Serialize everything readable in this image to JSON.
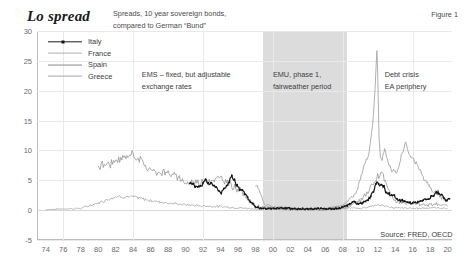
{
  "header": {
    "title": "Lo spread",
    "subtitle_line1": "Spreads, 10 year sovereign bonds,",
    "subtitle_line2": "compared to German “Bund”",
    "figure_number": "Figure  1"
  },
  "annotations": {
    "ems_line1": "EMS – fixed, but adjustable",
    "ems_line2": "exchange rates",
    "emu_line1": "EMU, phase 1,",
    "emu_line2": "fairweather period",
    "crisis_line1": "Debt crisis",
    "crisis_line2": "EA periphery",
    "source": "Source: FRED, OECD"
  },
  "chart_data": {
    "type": "line",
    "title": "Lo spread",
    "subtitle": "Spreads, 10 year sovereign bonds, compared to German “Bund”",
    "xlabel": "",
    "ylabel": "",
    "xlim": [
      1973,
      2020.5
    ],
    "ylim": [
      -5,
      30
    ],
    "grid": true,
    "legend_position": "top-left",
    "ytick_labels": [
      "30",
      "25",
      "20",
      "15",
      "10",
      "5",
      "0",
      "-5"
    ],
    "ytick_values": [
      30,
      25,
      20,
      15,
      10,
      5,
      0,
      -5
    ],
    "xtick_labels": [
      "74",
      "76",
      "78",
      "80",
      "82",
      "84",
      "86",
      "88",
      "90",
      "92",
      "94",
      "96",
      "98",
      "00",
      "02",
      "04",
      "06",
      "08",
      "10",
      "12",
      "14",
      "16",
      "18",
      "20"
    ],
    "xtick_values": [
      1974,
      1976,
      1978,
      1980,
      1982,
      1984,
      1986,
      1988,
      1990,
      1992,
      1994,
      1996,
      1998,
      2000,
      2002,
      2004,
      2006,
      2008,
      2010,
      2012,
      2014,
      2016,
      2018,
      2020
    ],
    "shaded_bands": [
      {
        "label": "EMU, phase 1, fairweather period",
        "x0": 1998.9,
        "x1": 2008.5,
        "color": "#d9d9d9"
      }
    ],
    "series": [
      {
        "name": "Italy",
        "color": "#1c1c1c",
        "style": "line-with-markers",
        "x": [
          1990.5,
          1990.9,
          1991.2,
          1991.5,
          1991.8,
          1992.1,
          1992.3,
          1992.5,
          1992.7,
          1992.9,
          1993.1,
          1993.4,
          1993.7,
          1994.0,
          1994.3,
          1994.6,
          1994.9,
          1995.1,
          1995.3,
          1995.5,
          1995.7,
          1995.9,
          1996.2,
          1996.5,
          1996.8,
          1997.1,
          1997.4,
          1997.7,
          1998.0,
          1998.3,
          1998.6,
          1998.9,
          1999.3,
          1999.8,
          2000.4,
          2001.0,
          2001.6,
          2002.2,
          2002.8,
          2003.4,
          2004.0,
          2004.6,
          2005.2,
          2005.8,
          2006.4,
          2007.0,
          2007.6,
          2008.1,
          2008.5,
          2008.9,
          2009.3,
          2009.8,
          2010.3,
          2010.8,
          2011.2,
          2011.5,
          2011.8,
          2012.0,
          2012.2,
          2012.4,
          2012.7,
          2013.0,
          2013.4,
          2013.8,
          2014.2,
          2014.7,
          2015.2,
          2015.8,
          2016.3,
          2016.8,
          2017.2,
          2017.7,
          2018.1,
          2018.5,
          2018.9,
          2019.3,
          2019.8,
          2020.2
        ],
        "y": [
          4.6,
          4.2,
          4.0,
          3.9,
          4.1,
          4.9,
          5.2,
          4.5,
          4.2,
          4.6,
          4.3,
          4.0,
          3.5,
          2.8,
          3.3,
          4.0,
          4.6,
          5.4,
          5.7,
          5.2,
          4.6,
          4.1,
          3.6,
          3.3,
          2.8,
          2.1,
          1.5,
          1.0,
          0.6,
          0.4,
          0.3,
          0.25,
          0.25,
          0.3,
          0.35,
          0.35,
          0.3,
          0.25,
          0.2,
          0.2,
          0.2,
          0.2,
          0.25,
          0.25,
          0.25,
          0.25,
          0.3,
          0.55,
          0.8,
          1.2,
          1.4,
          0.9,
          1.3,
          1.7,
          2.2,
          3.1,
          4.4,
          4.7,
          4.1,
          4.3,
          3.9,
          2.9,
          2.6,
          2.4,
          1.8,
          1.6,
          1.3,
          1.2,
          1.3,
          1.5,
          1.7,
          1.8,
          2.2,
          2.7,
          2.9,
          2.5,
          1.6,
          1.9
        ],
        "notes": "dark line with small square markers, begins ~1990"
      },
      {
        "name": "France",
        "color": "#9a9a9a",
        "style": "thin-line",
        "x": [
          1974,
          1976,
          1978,
          1980,
          1982,
          1984,
          1986,
          1988,
          1990,
          1992,
          1994,
          1996,
          1998,
          2000,
          2002,
          2004,
          2006,
          2008,
          2009,
          2010,
          2011,
          2012,
          2013,
          2014,
          2016,
          2018,
          2020
        ],
        "y": [
          0.1,
          0.2,
          0.3,
          1.2,
          2.3,
          2.2,
          1.6,
          1.2,
          0.9,
          0.7,
          0.6,
          0.4,
          0.2,
          0.15,
          0.1,
          0.05,
          0.05,
          0.2,
          0.4,
          0.3,
          0.6,
          0.9,
          0.6,
          0.4,
          0.3,
          0.4,
          0.3
        ],
        "notes": "lowest of the four, near zero after 1999"
      },
      {
        "name": "Spain",
        "color": "#8a8a8a",
        "style": "thin-line",
        "x": [
          1980,
          1982,
          1984,
          1986,
          1988,
          1990,
          1992,
          1994,
          1996,
          1998,
          2000,
          2002,
          2004,
          2006,
          2008,
          2009,
          2010,
          2011,
          2012,
          2012.5,
          2013,
          2014,
          2015,
          2016,
          2018,
          2020
        ],
        "y": [
          7.4,
          8.0,
          9.5,
          6.6,
          6.3,
          4.6,
          4.8,
          5.3,
          3.6,
          0.6,
          0.3,
          0.2,
          0.1,
          0.1,
          0.5,
          0.8,
          1.5,
          3.5,
          5.4,
          6.4,
          4.0,
          1.5,
          1.3,
          1.1,
          1.0,
          0.7
        ],
        "notes": "high in 1980s reaching ~9.5 in 1983-84"
      },
      {
        "name": "Greece",
        "color": "#a6a6a6",
        "style": "thin-line",
        "x": [
          1998,
          1998.6,
          1999,
          2000,
          2002,
          2004,
          2006,
          2008,
          2008.8,
          2009.4,
          2010.0,
          2010.5,
          2011.0,
          2011.4,
          2011.7,
          2011.9,
          2012.0,
          2012.15,
          2012.3,
          2012.5,
          2012.8,
          2013.2,
          2013.6,
          2014.0,
          2014.4,
          2014.8,
          2015.2,
          2015.6,
          2016.0,
          2016.6,
          2017.2,
          2018,
          2019,
          2020
        ],
        "y": [
          4.3,
          3.0,
          1.0,
          0.6,
          0.3,
          0.2,
          0.2,
          0.8,
          2.0,
          2.5,
          5.0,
          8.0,
          9.5,
          14.0,
          20.0,
          27.0,
          23.0,
          12.0,
          9.0,
          8.5,
          10.0,
          8.0,
          6.8,
          6.2,
          7.4,
          9.5,
          11.3,
          9.0,
          8.8,
          7.2,
          5.5,
          3.7,
          2.5,
          1.4
        ],
        "notes": "spikes to ~27 in early 2012, second hump ~11 in 2015"
      }
    ]
  }
}
